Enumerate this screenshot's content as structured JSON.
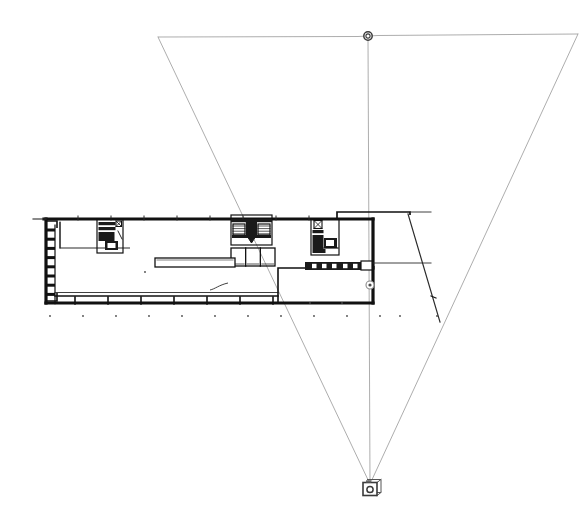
{
  "canvas": {
    "width": 586,
    "height": 532,
    "background": "#ffffff",
    "title": "Architectural Floor Plan with Camera View Cone"
  },
  "colors": {
    "wall_heavy": "#111111",
    "wall_light": "#2b2b2b",
    "poche_fill": "#1a1a1a",
    "cone_line": "#8a8a8a",
    "node_stroke": "#3a3a3a",
    "camera_body": "#555555",
    "dot": "#4a4a4a",
    "background": "#ffffff"
  },
  "view_cone": {
    "name": "camera-view-cone",
    "apex": {
      "x": 370,
      "y": 484
    },
    "far_left": {
      "x": 158,
      "y": 37
    },
    "far_right": {
      "x": 578,
      "y": 34
    },
    "center_axis_top": {
      "x": 368,
      "y": 36
    },
    "stroke_width": 0.7,
    "stroke_color": "#8a8a8a"
  },
  "camera": {
    "name": "camera-icon",
    "x": 370,
    "y": 489,
    "body_width": 14,
    "body_height": 13,
    "lens_radius": 3.1,
    "label": "camera"
  },
  "target_node_top": {
    "name": "view-target-node",
    "x": 368,
    "y": 36,
    "outer_radius": 4.2,
    "inner_radius": 2.1
  },
  "target_node_plan": {
    "name": "plan-target-node",
    "x": 370,
    "y": 285,
    "outer_radius": 4.0,
    "inner_radius": 1.6
  },
  "building": {
    "name": "building-footprint",
    "outer": {
      "left": 46,
      "top": 219,
      "right": 373,
      "bottom": 303,
      "wall_thickness": 3.2
    },
    "annex": {
      "name": "upper-right-annex",
      "left": 337,
      "top": 212,
      "right": 410,
      "bottom": 219
    },
    "lower_right_room": {
      "name": "lower-right-room",
      "left": 278,
      "top": 268,
      "right": 373,
      "bottom": 303
    },
    "interior_partition_top_left": {
      "name": "upper-left-partition",
      "left": 60,
      "top": 222,
      "right": 130,
      "bottom": 248
    },
    "left_wall_teeth": {
      "name": "left-wall-pilasters",
      "count": 8,
      "x_start": 46,
      "depth": 9,
      "y_first": 230,
      "spacing": 9.2,
      "thickness": 3
    },
    "bottom_inner_wall": {
      "name": "bottom-inner-wall",
      "left": 55,
      "y": 296,
      "right": 278
    },
    "bottom_tick_marks": {
      "name": "bottom-wall-ticks",
      "count": 7,
      "x_start": 75,
      "spacing": 33,
      "y_top": 297,
      "length": 7
    },
    "top_tick_marks": {
      "name": "top-wall-ticks",
      "count": 8,
      "x_start": 78,
      "spacing": 33,
      "y_top": 216,
      "length": 4
    },
    "ground_dots": {
      "name": "site-survey-dots",
      "count": 11,
      "x_start": 50,
      "spacing": 33,
      "y": 316,
      "radius": 0.9
    }
  },
  "furniture": {
    "long_counter": {
      "name": "long-counter",
      "x": 155,
      "y": 258,
      "width": 80,
      "height": 9
    },
    "squiggle": {
      "name": "freehand-squiggle-mark",
      "x": 210,
      "y": 283,
      "width": 18,
      "height": 7
    },
    "hatched_bar": {
      "name": "lower-hatched-wall-bar",
      "x": 305,
      "y": 262,
      "width": 57,
      "height": 8
    },
    "small_square_right": {
      "name": "small-square-fixture",
      "x": 361,
      "y": 261,
      "width": 11,
      "height": 9
    }
  },
  "cores": [
    {
      "name": "core-left-stair",
      "x": 97,
      "y": 219,
      "width": 26,
      "height": 34,
      "label": "stair-core-left"
    },
    {
      "name": "core-center-stair",
      "x": 231,
      "y": 215,
      "width": 41,
      "height": 30,
      "label": "stair-core-center"
    },
    {
      "name": "core-right-stair",
      "x": 311,
      "y": 219,
      "width": 28,
      "height": 36,
      "label": "stair-core-right"
    }
  ],
  "restroom_block": {
    "name": "restroom-block",
    "x": 231,
    "y": 248,
    "width": 44,
    "height": 18,
    "cells": 3
  },
  "section_line": {
    "name": "section-cut-line",
    "from": {
      "x": 408,
      "y": 214
    },
    "to": {
      "x": 440,
      "y": 322
    },
    "stroke_width": 1.2
  },
  "horizontal_leader": {
    "name": "horizontal-leader-line",
    "from": {
      "x": 373,
      "y": 263
    },
    "to": {
      "x": 431,
      "y": 263
    }
  },
  "annex_leader": {
    "name": "annex-leader-line",
    "from": {
      "x": 410,
      "y": 212
    },
    "to": {
      "x": 431,
      "y": 212
    }
  },
  "legend": {
    "drawing_type": "floor plan",
    "scale_note": "",
    "units": ""
  }
}
